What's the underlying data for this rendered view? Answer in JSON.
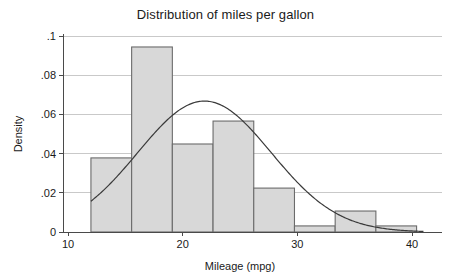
{
  "chart_data": {
    "type": "bar",
    "title": "Distribution of miles per gallon",
    "xlabel": "Mileage (mpg)",
    "ylabel": "Density",
    "xlim": [
      10,
      41
    ],
    "ylim": [
      0,
      0.1
    ],
    "xticks": [
      10,
      20,
      30,
      40
    ],
    "xtick_labels": [
      "10",
      "20",
      "30",
      "40"
    ],
    "yticks": [
      0,
      0.02,
      0.04,
      0.06,
      0.08,
      0.1
    ],
    "ytick_labels": [
      "0",
      ".02",
      ".04",
      ".06",
      ".08",
      ".1"
    ],
    "grid": "horizontal",
    "legend": "none",
    "bin_width": 3.55,
    "bars": [
      {
        "x0": 12.0,
        "x1": 15.55,
        "value": 0.0378
      },
      {
        "x0": 15.55,
        "x1": 19.1,
        "value": 0.0944
      },
      {
        "x0": 19.1,
        "x1": 22.65,
        "value": 0.0449
      },
      {
        "x0": 22.65,
        "x1": 26.2,
        "value": 0.0566
      },
      {
        "x0": 26.2,
        "x1": 29.75,
        "value": 0.0224
      },
      {
        "x0": 29.75,
        "x1": 33.3,
        "value": 0.0031
      },
      {
        "x0": 33.3,
        "x1": 36.85,
        "value": 0.0107
      },
      {
        "x0": 36.85,
        "x1": 40.4,
        "value": 0.0031
      }
    ],
    "overlay": {
      "name": "normal density",
      "type": "line",
      "mean": 21.9,
      "sd": 5.82,
      "peak_value": 0.0668,
      "x_start": 12.0,
      "x_end": 41.0
    },
    "colors": {
      "bar_fill": "#d8d8d8",
      "bar_edge": "#6b6b6b",
      "curve": "#3a3a3a",
      "grid": "#c9c9c9",
      "axis": "#4a4a4a",
      "text": "#1a1a1a",
      "background": "#ffffff"
    }
  }
}
